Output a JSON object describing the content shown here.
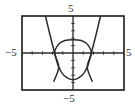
{
  "chart_data": {
    "type": "line",
    "title": "",
    "xlabel": "",
    "ylabel": "",
    "xlim": [
      -5,
      5
    ],
    "ylim": [
      -5,
      5
    ],
    "grid": false,
    "tick_labels": {
      "x_min": "−5",
      "x_max": "5",
      "y_min": "−5",
      "y_max": "5"
    },
    "x_ticks_step": 1,
    "y_ticks_step": 1,
    "series": [
      {
        "name": "upward-parabola",
        "points": [
          [
            -2.7,
            5
          ],
          [
            -2.3,
            2.7
          ],
          [
            -1.8,
            0
          ],
          [
            -1.4,
            -1.9
          ],
          [
            -0.9,
            -3.0
          ],
          [
            0,
            -3.6
          ],
          [
            0.9,
            -3.0
          ],
          [
            1.4,
            -1.9
          ],
          [
            1.8,
            0
          ],
          [
            2.3,
            2.7
          ],
          [
            2.7,
            5
          ]
        ]
      },
      {
        "name": "downward-arc",
        "points": [
          [
            -1.9,
            -3.9
          ],
          [
            -1.4,
            -1.9
          ],
          [
            -1.8,
            0
          ],
          [
            -1.4,
            1.2
          ],
          [
            -0.8,
            1.7
          ],
          [
            0,
            1.8
          ],
          [
            0.8,
            1.7
          ],
          [
            1.4,
            1.2
          ],
          [
            1.8,
            0
          ],
          [
            1.4,
            -1.9
          ],
          [
            1.9,
            -3.9
          ]
        ]
      }
    ],
    "colors": {
      "curve": "#2b2b2b",
      "axis": "#2b2b2b",
      "frame": "#1a1a1a"
    }
  },
  "labels": {
    "y_top": "5",
    "y_bottom": "−5",
    "x_left": "−5",
    "x_right": "5"
  }
}
